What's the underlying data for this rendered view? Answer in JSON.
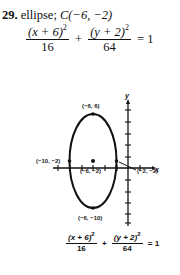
{
  "problem": {
    "number": "29.",
    "type": "ellipse;",
    "center_label": "C(−6, −2)"
  },
  "equation_top": {
    "term1_num": "(x + 6)",
    "term1_exp": "2",
    "term1_den": "16",
    "plus": "+",
    "term2_num": "(y + 2)",
    "term2_exp": "2",
    "term2_den": "64",
    "equals": "= 1"
  },
  "graph": {
    "x_axis_label": "x",
    "y_axis_label": "y",
    "points": [
      {
        "label": "(−6, 6)",
        "role": "top-vertex"
      },
      {
        "label": "(−10, −2)",
        "role": "left-co-vertex"
      },
      {
        "label": "(−6, −2)",
        "role": "center"
      },
      {
        "label": "(−2, −2)",
        "role": "right-co-vertex"
      },
      {
        "label": "(−6, −10)",
        "role": "bottom-vertex"
      }
    ]
  },
  "equation_bottom": {
    "term1_num": "(x + 6)",
    "term1_exp": "2",
    "term1_den": "16",
    "plus": "+",
    "term2_num": "(y + 2)",
    "term2_exp": "2",
    "term2_den": "64",
    "equals": "= 1"
  },
  "colors": {
    "ink": "#111111",
    "background": "#ffffff"
  }
}
